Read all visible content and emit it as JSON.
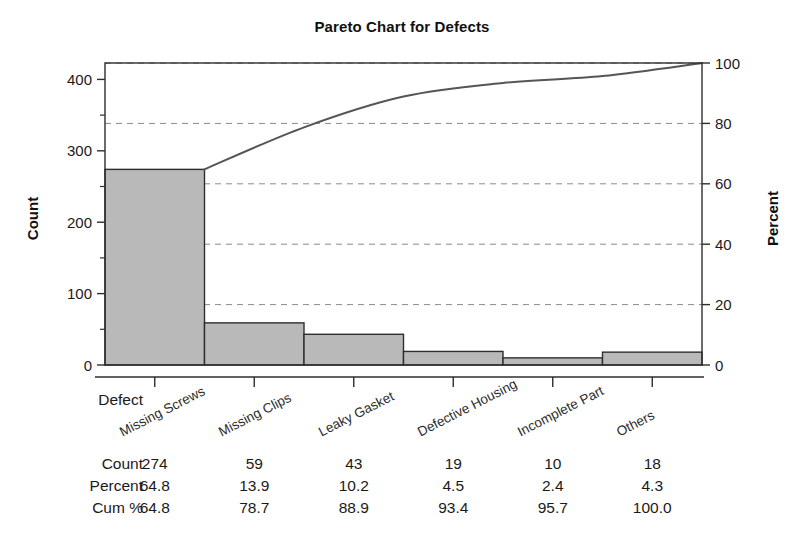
{
  "chart_data": {
    "type": "bar",
    "title": "Pareto Chart for Defects",
    "xlabel": "Defect",
    "ylabel": "Count",
    "y2label": "Percent",
    "categories": [
      "Missing Screws",
      "Missing Clips",
      "Leaky Gasket",
      "Defective Housing",
      "Incomplete Part",
      "Others"
    ],
    "values": [
      274,
      59,
      43,
      19,
      10,
      18
    ],
    "percent": [
      64.8,
      13.9,
      10.2,
      4.5,
      2.4,
      4.3
    ],
    "cum_percent": [
      64.8,
      78.7,
      88.9,
      93.4,
      95.7,
      100.0
    ],
    "ylim": [
      0,
      423
    ],
    "y2lim": [
      0,
      100
    ],
    "yticks": [
      0,
      100,
      200,
      300,
      400
    ],
    "y2ticks": [
      0,
      20,
      40,
      60,
      80,
      100
    ],
    "grid": true,
    "grid_axis": "y2",
    "legend": "none",
    "series": [
      {
        "name": "Count",
        "type": "bar",
        "values": [
          274,
          59,
          43,
          19,
          10,
          18
        ]
      },
      {
        "name": "Cum %",
        "type": "line",
        "values": [
          64.8,
          78.7,
          88.9,
          93.4,
          95.7,
          100.0
        ]
      }
    ],
    "colors": {
      "bar_fill": "#b9b9b9",
      "bar_stroke": "#2e2e2e",
      "line": "#555555",
      "grid": "#8a8a8a",
      "axis": "#2e2e2e",
      "text": "#1a1a1a"
    }
  },
  "table": {
    "row_labels": [
      "Count",
      "Percent",
      "Cum %"
    ],
    "rows": [
      [
        "274",
        "59",
        "43",
        "19",
        "10",
        "18"
      ],
      [
        "64.8",
        "13.9",
        "10.2",
        "4.5",
        "2.4",
        "4.3"
      ],
      [
        "64.8",
        "78.7",
        "88.9",
        "93.4",
        "95.7",
        "100.0"
      ]
    ],
    "corner_label": "Defect"
  },
  "axes": {
    "left_ticks": [
      "0",
      "100",
      "200",
      "300",
      "400"
    ],
    "right_ticks": [
      "0",
      "20",
      "40",
      "60",
      "80",
      "100"
    ]
  }
}
